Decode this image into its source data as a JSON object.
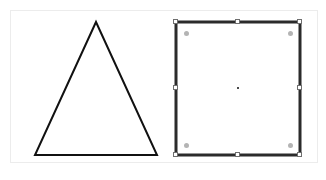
{
  "app": {
    "title": "Shape Editor Canvas",
    "background_color": "#ffffff"
  },
  "canvas": {
    "name": "drawing-canvas",
    "x": 10,
    "y": 10,
    "width": 308,
    "height": 153,
    "fill": "#ffffff",
    "border_color": "#ececec"
  },
  "shapes": [
    {
      "id": "triangle",
      "type": "triangle",
      "label": "Triangle",
      "selected": false,
      "stroke": "#111111",
      "stroke_width": 2,
      "fill": "none",
      "points": "96,22 157,155 35,155",
      "vertices": [
        {
          "name": "apex",
          "x": 96,
          "y": 22
        },
        {
          "name": "bottom-right",
          "x": 157,
          "y": 155
        },
        {
          "name": "bottom-left",
          "x": 35,
          "y": 155
        }
      ]
    },
    {
      "id": "rectangle",
      "type": "rectangle",
      "label": "Rectangle",
      "selected": true,
      "stroke": "#2b2b2b",
      "stroke_width": 3,
      "fill": "none",
      "x": 176,
      "y": 22,
      "width": 124,
      "height": 133
    }
  ],
  "selection": {
    "target": "rectangle",
    "handle_fill": "#ffffff",
    "handle_stroke": "#6e6e6e",
    "rotation_dot_color": "#b4b4b4",
    "center_marker_color": "#4a4a4a",
    "handles": [
      {
        "name": "resize-handle-top-left",
        "x": 176,
        "y": 22,
        "cursor": "nwse-resize"
      },
      {
        "name": "resize-handle-top-center",
        "x": 238,
        "y": 22,
        "cursor": "ns-resize"
      },
      {
        "name": "resize-handle-top-right",
        "x": 300,
        "y": 22,
        "cursor": "nesw-resize"
      },
      {
        "name": "resize-handle-middle-left",
        "x": 176,
        "y": 88,
        "cursor": "ew-resize"
      },
      {
        "name": "resize-handle-middle-right",
        "x": 300,
        "y": 88,
        "cursor": "ew-resize"
      },
      {
        "name": "resize-handle-bottom-left",
        "x": 176,
        "y": 155,
        "cursor": "nesw-resize"
      },
      {
        "name": "resize-handle-bottom-center",
        "x": 238,
        "y": 155,
        "cursor": "ns-resize"
      },
      {
        "name": "resize-handle-bottom-right",
        "x": 300,
        "y": 155,
        "cursor": "nwse-resize"
      }
    ],
    "rotation_dots": [
      {
        "name": "rotate-handle-top-left",
        "x": 186,
        "y": 33
      },
      {
        "name": "rotate-handle-top-right",
        "x": 290,
        "y": 33
      },
      {
        "name": "rotate-handle-bottom-left",
        "x": 186,
        "y": 145
      },
      {
        "name": "rotate-handle-bottom-right",
        "x": 290,
        "y": 145
      }
    ],
    "center_marker": {
      "name": "pivot-marker",
      "x": 238,
      "y": 88
    }
  }
}
